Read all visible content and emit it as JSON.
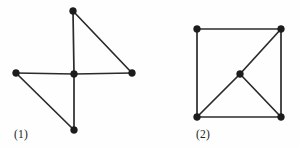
{
  "document": {
    "kind": "graph-theory-figure-pair",
    "background_color": "#fefefe",
    "ink_color": "#2b2b2b",
    "vertex_color": "#1c1c1c",
    "width": 299,
    "height": 148
  },
  "figures": [
    {
      "id": "figure-1",
      "caption": "(1)",
      "caption_x": 14,
      "caption_y": 138,
      "vertex_radius": 3.4,
      "vertices": [
        {
          "name": "top",
          "label": "top-vertex",
          "x": 73,
          "y": 11
        },
        {
          "name": "left",
          "label": "left-vertex",
          "x": 16,
          "y": 73
        },
        {
          "name": "center",
          "label": "center-vertex",
          "x": 74,
          "y": 74
        },
        {
          "name": "right",
          "label": "right-vertex",
          "x": 132,
          "y": 73
        },
        {
          "name": "bottom",
          "label": "bottom-vertex",
          "x": 74,
          "y": 130
        }
      ],
      "edges": [
        {
          "name": "center-to-top",
          "from": "center",
          "to": "top"
        },
        {
          "name": "center-to-left",
          "from": "center",
          "to": "left"
        },
        {
          "name": "center-to-right",
          "from": "center",
          "to": "right"
        },
        {
          "name": "center-to-bottom",
          "from": "center",
          "to": "bottom"
        },
        {
          "name": "top-to-right",
          "from": "top",
          "to": "right"
        },
        {
          "name": "left-to-bottom",
          "from": "left",
          "to": "bottom"
        }
      ]
    },
    {
      "id": "figure-2",
      "caption": "(2)",
      "caption_x": 196,
      "caption_y": 138,
      "vertex_radius": 3.4,
      "vertices": [
        {
          "name": "top-left",
          "label": "top-left-vertex",
          "x": 197,
          "y": 29
        },
        {
          "name": "top-right",
          "label": "top-right-vertex",
          "x": 281,
          "y": 29
        },
        {
          "name": "center",
          "label": "center-vertex",
          "x": 240,
          "y": 74
        },
        {
          "name": "bottom-left",
          "label": "bottom-left-vertex",
          "x": 197,
          "y": 117
        },
        {
          "name": "bottom-right",
          "label": "bottom-right-vertex",
          "x": 281,
          "y": 117
        }
      ],
      "edges": [
        {
          "name": "top-edge",
          "from": "top-left",
          "to": "top-right"
        },
        {
          "name": "left-edge",
          "from": "top-left",
          "to": "bottom-left"
        },
        {
          "name": "right-edge",
          "from": "top-right",
          "to": "bottom-right"
        },
        {
          "name": "bottom-edge",
          "from": "bottom-left",
          "to": "bottom-right"
        },
        {
          "name": "diagonal-lower-half",
          "from": "bottom-left",
          "to": "center"
        },
        {
          "name": "diagonal-upper-half",
          "from": "center",
          "to": "top-right"
        },
        {
          "name": "center-to-bottom-right",
          "from": "center",
          "to": "bottom-right"
        }
      ]
    }
  ]
}
